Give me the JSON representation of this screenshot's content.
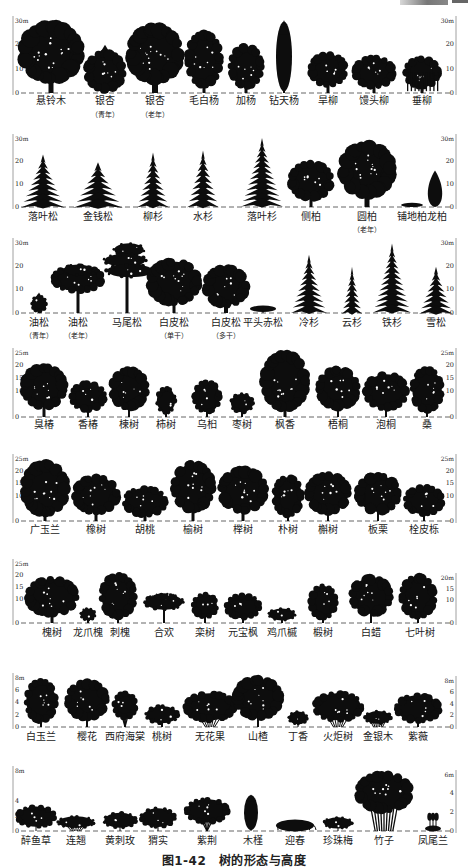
{
  "figure": {
    "caption": "图1-42　树的形态与高度",
    "ink_color": "#0d0d0d",
    "axis_color": "#888888",
    "ground_color": "#555555"
  },
  "rows": [
    {
      "id": "row1",
      "top": 20,
      "ground": 93,
      "label_y": 104,
      "sub_y": 117,
      "left_axis": {
        "max_label": "30m",
        "ticks": [
          {
            "v": "20",
            "f": 0.667
          },
          {
            "v": "10",
            "f": 0.333
          },
          {
            "v": "0",
            "f": 0
          }
        ]
      },
      "right_axis": {
        "max_label": "30m",
        "ticks": [
          {
            "v": "20",
            "f": 0.667
          },
          {
            "v": "10",
            "f": 0.333
          },
          {
            "v": "0",
            "f": 0
          }
        ]
      },
      "trees": [
        {
          "name": "悬铃木",
          "x": 51,
          "h": 0.96,
          "w": 62,
          "shape": "round",
          "trunk": 5
        },
        {
          "name": "银杏",
          "sub": "（青年）",
          "x": 105,
          "h": 0.66,
          "w": 40,
          "shape": "cone_round",
          "trunk": 3
        },
        {
          "name": "银杏",
          "sub": "（老年）",
          "x": 155,
          "h": 0.93,
          "w": 54,
          "shape": "round",
          "trunk": 6
        },
        {
          "name": "毛白杨",
          "x": 204,
          "h": 0.84,
          "w": 36,
          "shape": "oval",
          "trunk": 3
        },
        {
          "name": "加杨",
          "x": 246,
          "h": 0.66,
          "w": 34,
          "shape": "oval",
          "trunk": 3
        },
        {
          "name": "钻天杨",
          "x": 284,
          "h": 1.0,
          "w": 16,
          "shape": "columnar",
          "trunk": 2
        },
        {
          "name": "旱柳",
          "x": 328,
          "h": 0.55,
          "w": 38,
          "shape": "round",
          "trunk": 3
        },
        {
          "name": "馒头柳",
          "x": 374,
          "h": 0.52,
          "w": 42,
          "shape": "dome",
          "trunk": 3
        },
        {
          "name": "垂柳",
          "x": 422,
          "h": 0.51,
          "w": 36,
          "shape": "weeping",
          "trunk": 3
        }
      ]
    },
    {
      "id": "row2",
      "top": 138,
      "ground": 207,
      "label_y": 220,
      "left_axis": {
        "max_label": "30m",
        "ticks": [
          {
            "v": "20",
            "f": 0.667
          },
          {
            "v": "10",
            "f": 0.333
          },
          {
            "v": "0",
            "f": 0
          }
        ]
      },
      "right_axis": {
        "max_label": "30m",
        "ticks": [
          {
            "v": "20",
            "f": 0.667
          },
          {
            "v": "10",
            "f": 0.333
          },
          {
            "v": "0",
            "f": 0
          }
        ]
      },
      "trees": [
        {
          "name": "落叶松",
          "x": 43,
          "h": 0.76,
          "w": 44,
          "shape": "conifer",
          "trunk": 2
        },
        {
          "name": "金钱松",
          "x": 98,
          "h": 0.65,
          "w": 50,
          "shape": "conifer_wide",
          "trunk": 2
        },
        {
          "name": "柳杉",
          "x": 153,
          "h": 0.79,
          "w": 32,
          "shape": "conifer",
          "trunk": 2
        },
        {
          "name": "水杉",
          "x": 203,
          "h": 0.82,
          "w": 32,
          "shape": "conifer",
          "trunk": 2
        },
        {
          "name": "落叶杉",
          "x": 262,
          "h": 1.0,
          "w": 42,
          "shape": "conifer",
          "trunk": 2
        },
        {
          "name": "侧柏",
          "x": 311,
          "h": 0.66,
          "w": 44,
          "shape": "round",
          "trunk": 3
        },
        {
          "name": "圆柏",
          "sub": "（老年）",
          "x": 367,
          "h": 0.93,
          "w": 54,
          "shape": "round",
          "trunk": 5
        },
        {
          "name": "铺地柏",
          "x": 412,
          "h": 0.06,
          "w": 22,
          "shape": "mat",
          "trunk": 0
        },
        {
          "name": "龙柏",
          "x": 435,
          "h": 0.53,
          "w": 16,
          "shape": "flame",
          "trunk": 1
        }
      ],
      "label_x_override": [
        43,
        98,
        153,
        203,
        262,
        311,
        367,
        412,
        437
      ]
    },
    {
      "id": "row3",
      "top": 242,
      "ground": 313,
      "label_y": 326,
      "sub_y": 338,
      "left_axis": {
        "max_label": "30m",
        "ticks": [
          {
            "v": "20",
            "f": 0.667
          },
          {
            "v": "10",
            "f": 0.333
          },
          {
            "v": "0",
            "f": 0
          }
        ]
      },
      "right_axis": {
        "max_label": "30m",
        "ticks": [
          {
            "v": "20",
            "f": 0.667
          },
          {
            "v": "10",
            "f": 0.333
          },
          {
            "v": "0",
            "f": 0
          }
        ]
      },
      "trees": [
        {
          "name": "油松",
          "sub": "（青年）",
          "x": 39,
          "h": 0.29,
          "w": 16,
          "shape": "cone_round",
          "trunk": 2
        },
        {
          "name": "油松",
          "sub": "（老年）",
          "x": 78,
          "h": 0.69,
          "w": 52,
          "shape": "umbrella",
          "trunk": 3
        },
        {
          "name": "马尾松",
          "x": 127,
          "h": 0.99,
          "w": 50,
          "shape": "pine_tiered",
          "trunk": 3
        },
        {
          "name": "白皮松",
          "sub": "（单干）",
          "x": 174,
          "h": 0.75,
          "w": 52,
          "shape": "round",
          "trunk": 3
        },
        {
          "name": "白皮松",
          "sub": "（多干）",
          "x": 226,
          "h": 0.68,
          "w": 44,
          "shape": "dome_round",
          "trunk": 4
        },
        {
          "name": "平头赤松",
          "x": 263,
          "h": 0.1,
          "w": 26,
          "shape": "flat",
          "trunk": 1
        },
        {
          "name": "冷杉",
          "x": 309,
          "h": 0.82,
          "w": 36,
          "shape": "conifer",
          "trunk": 2
        },
        {
          "name": "云杉",
          "x": 352,
          "h": 0.65,
          "w": 24,
          "shape": "conifer_narrow",
          "trunk": 1
        },
        {
          "name": "铁杉",
          "x": 392,
          "h": 0.98,
          "w": 38,
          "shape": "conifer",
          "trunk": 1
        },
        {
          "name": "雪松",
          "x": 436,
          "h": 0.65,
          "w": 34,
          "shape": "conifer_wide",
          "trunk": 1
        }
      ]
    },
    {
      "id": "row4",
      "top": 352,
      "ground": 417,
      "label_y": 428,
      "left_axis": {
        "max_label": "25m",
        "ticks": [
          {
            "v": "20",
            "f": 0.8
          },
          {
            "v": "15",
            "f": 0.6
          },
          {
            "v": "10",
            "f": 0.4
          },
          {
            "v": "0",
            "f": 0
          }
        ]
      },
      "right_axis": {
        "max_label": "25m",
        "ticks": [
          {
            "v": "20",
            "f": 0.8
          },
          {
            "v": "15",
            "f": 0.6
          },
          {
            "v": "10",
            "f": 0.4
          },
          {
            "v": "0",
            "f": 0
          }
        ]
      },
      "trees": [
        {
          "name": "臭椿",
          "x": 44,
          "h": 0.8,
          "w": 44,
          "shape": "round",
          "trunk": 3
        },
        {
          "name": "香椿",
          "x": 88,
          "h": 0.54,
          "w": 36,
          "shape": "round",
          "trunk": 2
        },
        {
          "name": "楝树",
          "x": 129,
          "h": 0.75,
          "w": 38,
          "shape": "round",
          "trunk": 2
        },
        {
          "name": "柿树",
          "x": 166,
          "h": 0.46,
          "w": 20,
          "shape": "oval",
          "trunk": 2
        },
        {
          "name": "乌桕",
          "x": 207,
          "h": 0.56,
          "w": 28,
          "shape": "oval",
          "trunk": 2
        },
        {
          "name": "枣树",
          "x": 242,
          "h": 0.37,
          "w": 24,
          "shape": "round",
          "trunk": 2
        },
        {
          "name": "枫香",
          "x": 285,
          "h": 1.0,
          "w": 46,
          "shape": "oval",
          "trunk": 3
        },
        {
          "name": "梧桐",
          "x": 338,
          "h": 0.76,
          "w": 42,
          "shape": "round",
          "trunk": 2
        },
        {
          "name": "泡桐",
          "x": 386,
          "h": 0.68,
          "w": 44,
          "shape": "round",
          "trunk": 2
        },
        {
          "name": "桑",
          "x": 427,
          "h": 0.76,
          "w": 32,
          "shape": "oval",
          "trunk": 2
        }
      ]
    },
    {
      "id": "row5",
      "top": 458,
      "ground": 521,
      "label_y": 533,
      "left_axis": {
        "max_label": "25m",
        "ticks": [
          {
            "v": "20",
            "f": 0.8
          },
          {
            "v": "15",
            "f": 0.6
          },
          {
            "v": "10",
            "f": 0.4
          },
          {
            "v": "0",
            "f": 0
          }
        ]
      },
      "right_axis": {
        "max_label": "25m",
        "ticks": [
          {
            "v": "20",
            "f": 0.8
          },
          {
            "v": "15",
            "f": 0.6
          },
          {
            "v": "10",
            "f": 0.4
          },
          {
            "v": "0",
            "f": 0
          }
        ]
      },
      "trees": [
        {
          "name": "广玉兰",
          "x": 45,
          "h": 0.94,
          "w": 46,
          "shape": "oval",
          "trunk": 3
        },
        {
          "name": "橡树",
          "x": 96,
          "h": 0.72,
          "w": 46,
          "shape": "round",
          "trunk": 3
        },
        {
          "name": "胡桃",
          "x": 145,
          "h": 0.56,
          "w": 44,
          "shape": "dome_round",
          "trunk": 3
        },
        {
          "name": "榆树",
          "x": 193,
          "h": 0.94,
          "w": 42,
          "shape": "round",
          "trunk": 3
        },
        {
          "name": "榉树",
          "x": 243,
          "h": 0.84,
          "w": 48,
          "shape": "round",
          "trunk": 3
        },
        {
          "name": "朴树",
          "x": 288,
          "h": 0.72,
          "w": 30,
          "shape": "oval",
          "trunk": 2
        },
        {
          "name": "槲树",
          "x": 328,
          "h": 0.76,
          "w": 44,
          "shape": "round",
          "trunk": 2
        },
        {
          "name": "板栗",
          "x": 378,
          "h": 0.75,
          "w": 44,
          "shape": "round",
          "trunk": 2
        },
        {
          "name": "栓皮栎",
          "x": 424,
          "h": 0.56,
          "w": 40,
          "shape": "round",
          "trunk": 2
        }
      ]
    },
    {
      "id": "row6",
      "top": 563,
      "ground": 623,
      "label_y": 636,
      "left_axis": {
        "max_label": "25m",
        "ticks": [
          {
            "v": "20",
            "f": 0.8
          },
          {
            "v": "15",
            "f": 0.6
          },
          {
            "v": "10",
            "f": 0.4
          },
          {
            "v": "0",
            "f": 0
          }
        ]
      },
      "right_axis": {
        "max_label": "20m",
        "top_offset": 14,
        "ticks": [
          {
            "v": "15",
            "f": 0.75
          },
          {
            "v": "10",
            "f": 0.5
          },
          {
            "v": "0",
            "f": 0
          }
        ]
      },
      "trees": [
        {
          "name": "槐树",
          "x": 52,
          "h": 0.76,
          "w": 52,
          "shape": "round",
          "trunk": 3
        },
        {
          "name": "龙爪槐",
          "x": 88,
          "h": 0.26,
          "w": 16,
          "shape": "dome",
          "trunk": 2
        },
        {
          "name": "刺槐",
          "x": 118,
          "h": 0.82,
          "w": 36,
          "shape": "oval",
          "trunk": 2
        },
        {
          "name": "合欢",
          "x": 164,
          "h": 0.5,
          "w": 40,
          "shape": "umbrella_round",
          "trunk": 2
        },
        {
          "name": "栾树",
          "x": 205,
          "h": 0.5,
          "w": 26,
          "shape": "round",
          "trunk": 2
        },
        {
          "name": "元宝枫",
          "x": 243,
          "h": 0.5,
          "w": 36,
          "shape": "dome_round",
          "trunk": 2
        },
        {
          "name": "鸡爪槭",
          "x": 282,
          "h": 0.26,
          "w": 28,
          "shape": "dome",
          "trunk": 2
        },
        {
          "name": "椴树",
          "x": 323,
          "h": 0.64,
          "w": 28,
          "shape": "oval",
          "trunk": 2
        },
        {
          "name": "白蜡",
          "x": 371,
          "h": 0.78,
          "w": 42,
          "shape": "round",
          "trunk": 2
        },
        {
          "name": "七叶树",
          "x": 418,
          "h": 0.8,
          "w": 36,
          "shape": "oval",
          "trunk": 2
        }
      ],
      "label_x_override": [
        52,
        88,
        120,
        164,
        205,
        243,
        282,
        323,
        371,
        420
      ]
    },
    {
      "id": "row7",
      "top": 677,
      "ground": 727,
      "label_y": 740,
      "left_axis": {
        "max_label": "8m",
        "ticks": [
          {
            "v": "6",
            "f": 0.75
          },
          {
            "v": "4",
            "f": 0.5
          },
          {
            "v": "2",
            "f": 0.25
          },
          {
            "v": "0",
            "f": 0
          }
        ]
      },
      "right_axis": {
        "max_label": "8m",
        "top_offset": 3,
        "ticks": [
          {
            "v": "6",
            "f": 0.75
          },
          {
            "v": "4",
            "f": 0.5
          },
          {
            "v": "2",
            "f": 0.25
          },
          {
            "v": "0",
            "f": 0
          }
        ]
      },
      "trees": [
        {
          "name": "白玉兰",
          "x": 41,
          "h": 0.95,
          "w": 32,
          "shape": "oval",
          "trunk": 2
        },
        {
          "name": "樱花",
          "x": 87,
          "h": 0.93,
          "w": 42,
          "shape": "round",
          "trunk": 2
        },
        {
          "name": "西府海棠",
          "x": 125,
          "h": 0.72,
          "w": 24,
          "shape": "vase",
          "trunk": 2
        },
        {
          "name": "桃树",
          "x": 162,
          "h": 0.45,
          "w": 34,
          "shape": "dome_round",
          "trunk": 2
        },
        {
          "name": "无花果",
          "x": 210,
          "h": 0.7,
          "w": 52,
          "shape": "shrub_dome",
          "trunk": 2
        },
        {
          "name": "山楂",
          "x": 258,
          "h": 1.0,
          "w": 48,
          "shape": "round",
          "trunk": 2
        },
        {
          "name": "丁香",
          "x": 298,
          "h": 0.33,
          "w": 20,
          "shape": "dome",
          "trunk": 1
        },
        {
          "name": "火炬树",
          "x": 338,
          "h": 0.7,
          "w": 50,
          "shape": "shrub_dome",
          "trunk": 2
        },
        {
          "name": "金银木",
          "x": 378,
          "h": 0.33,
          "w": 28,
          "shape": "shrub_dome",
          "trunk": 1
        },
        {
          "name": "紫薇",
          "x": 418,
          "h": 0.68,
          "w": 46,
          "shape": "dome_round",
          "trunk": 2
        }
      ]
    },
    {
      "id": "row8",
      "top": 770,
      "ground": 831,
      "label_y": 844,
      "left_axis": {
        "max_label": "8m",
        "ticks": [
          {
            "v": "4",
            "f": 0.5
          },
          {
            "v": "2",
            "f": 0.25
          },
          {
            "v": "0",
            "f": 0
          }
        ]
      },
      "right_axis": {
        "max_label": "6m",
        "top_offset": 4,
        "ticks": [
          {
            "v": "4",
            "f": 0.667
          },
          {
            "v": "2",
            "f": 0.333
          },
          {
            "v": "0",
            "f": 0
          }
        ]
      },
      "trees": [
        {
          "name": "醉鱼草",
          "x": 36,
          "h": 0.43,
          "w": 40,
          "shape": "dome_round",
          "trunk": 1
        },
        {
          "name": "连翘",
          "x": 76,
          "h": 0.25,
          "w": 38,
          "shape": "shrub_dome",
          "trunk": 1
        },
        {
          "name": "黄刺玫",
          "x": 120,
          "h": 0.32,
          "w": 34,
          "shape": "dome_round",
          "trunk": 1
        },
        {
          "name": "猬实",
          "x": 158,
          "h": 0.4,
          "w": 36,
          "shape": "dome_round",
          "trunk": 1
        },
        {
          "name": "紫荆",
          "x": 207,
          "h": 0.55,
          "w": 44,
          "shape": "vase",
          "trunk": 2
        },
        {
          "name": "木槿",
          "x": 251,
          "h": 0.6,
          "w": 14,
          "shape": "columnar",
          "trunk": 1
        },
        {
          "name": "迎春",
          "x": 295,
          "h": 0.2,
          "w": 38,
          "shape": "mat_arch",
          "trunk": 0
        },
        {
          "name": "珍珠梅",
          "x": 338,
          "h": 0.24,
          "w": 30,
          "shape": "dome_round",
          "trunk": 1
        },
        {
          "name": "竹子",
          "x": 384,
          "h": 0.98,
          "w": 56,
          "shape": "bamboo",
          "trunk": 2
        },
        {
          "name": "凤尾兰",
          "x": 433,
          "h": 0.3,
          "w": 16,
          "shape": "yucca",
          "trunk": 0
        }
      ],
      "label_x_override": [
        36,
        76,
        120,
        158,
        207,
        253,
        295,
        338,
        384,
        433
      ]
    }
  ]
}
